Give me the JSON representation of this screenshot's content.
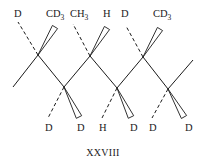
{
  "diagram": {
    "type": "stereochemical-zigzag-chain",
    "caption": "XXVIII",
    "colors": {
      "ink": "#1a1a1a",
      "background": "#ffffff"
    },
    "backbone": {
      "points": [
        [
          13,
          87
        ],
        [
          38,
          55
        ],
        [
          64,
          87
        ],
        [
          90,
          56
        ],
        [
          117,
          88
        ],
        [
          143,
          57
        ],
        [
          168,
          89
        ],
        [
          193,
          60
        ]
      ]
    },
    "substituents": [
      {
        "atom": 0,
        "position": "up",
        "bond": "dashed",
        "label": "D",
        "label_sub": "",
        "label_xy": [
          14,
          17
        ],
        "end": [
          18,
          22
        ]
      },
      {
        "atom": 0,
        "position": "up",
        "bond": "wedge",
        "label": "CD",
        "label_sub": "3",
        "label_xy": [
          46,
          17
        ],
        "end": [
          55,
          27
        ]
      },
      {
        "atom": 1,
        "position": "down",
        "bond": "dashed",
        "label": "D",
        "label_sub": "",
        "label_xy": [
          45,
          131
        ],
        "end": [
          48,
          118
        ]
      },
      {
        "atom": 1,
        "position": "down",
        "bond": "wedge",
        "label": "D",
        "label_sub": "",
        "label_xy": [
          77,
          131
        ],
        "end": [
          79,
          117
        ]
      },
      {
        "atom": 2,
        "position": "up",
        "bond": "dashed",
        "label": "CH",
        "label_sub": "3",
        "label_xy": [
          70,
          17
        ],
        "end": [
          73,
          24
        ]
      },
      {
        "atom": 2,
        "position": "up",
        "bond": "wedge",
        "label": "H",
        "label_sub": "",
        "label_xy": [
          103,
          17
        ],
        "end": [
          107,
          28
        ]
      },
      {
        "atom": 3,
        "position": "down",
        "bond": "dashed",
        "label": "H",
        "label_sub": "",
        "label_xy": [
          99,
          131
        ],
        "end": [
          102,
          118
        ]
      },
      {
        "atom": 3,
        "position": "down",
        "bond": "wedge",
        "label": "D",
        "label_sub": "",
        "label_xy": [
          130,
          131
        ],
        "end": [
          131,
          117
        ]
      },
      {
        "atom": 4,
        "position": "up",
        "bond": "dashed",
        "label": "D",
        "label_sub": "",
        "label_xy": [
          121,
          17
        ],
        "end": [
          126,
          26
        ]
      },
      {
        "atom": 4,
        "position": "up",
        "bond": "wedge",
        "label": "CD",
        "label_sub": "3",
        "label_xy": [
          153,
          17
        ],
        "end": [
          160,
          29
        ]
      },
      {
        "atom": 5,
        "position": "down",
        "bond": "dashed",
        "label": "D",
        "label_sub": "",
        "label_xy": [
          149,
          131
        ],
        "end": [
          152,
          118
        ]
      },
      {
        "atom": 5,
        "position": "down",
        "bond": "wedge",
        "label": "D",
        "label_sub": "",
        "label_xy": [
          185,
          131
        ],
        "end": [
          184,
          117
        ]
      }
    ]
  }
}
